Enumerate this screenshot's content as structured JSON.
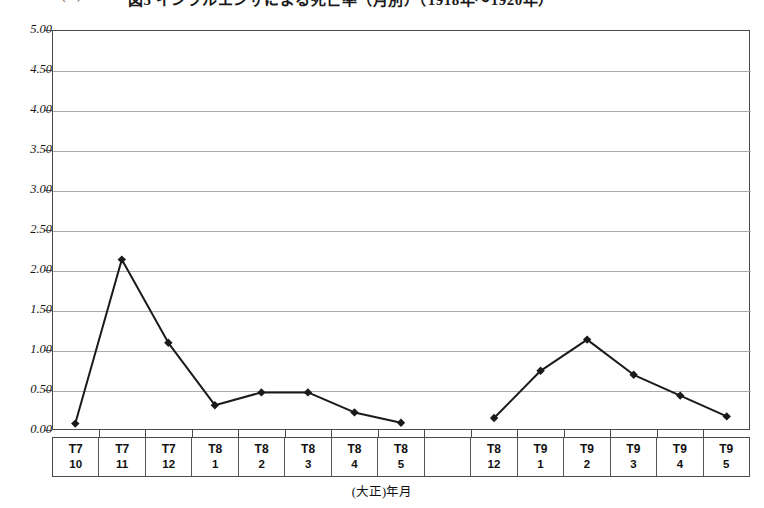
{
  "chart_data": {
    "type": "line",
    "title": "図5 インフルエンザによる死亡率（月別）（1918年～1920年）",
    "unit_label": "(‰)",
    "xlabel": "(大正)年月",
    "ylabel": "",
    "ylim": [
      0.0,
      5.0
    ],
    "ytick_step": 0.5,
    "grid": true,
    "legend": "none",
    "ytick_labels": [
      "0.00",
      "0.50",
      "1.00",
      "1.50",
      "2.00",
      "2.50",
      "3.00",
      "3.50",
      "4.00",
      "4.50",
      "5.00"
    ],
    "ytick_values": [
      0.0,
      0.5,
      1.0,
      1.5,
      2.0,
      2.5,
      3.0,
      3.5,
      4.0,
      4.5,
      5.0
    ],
    "categories": [
      {
        "year": "T7",
        "month": "10"
      },
      {
        "year": "T7",
        "month": "11"
      },
      {
        "year": "T7",
        "month": "12"
      },
      {
        "year": "T8",
        "month": "1"
      },
      {
        "year": "T8",
        "month": "2"
      },
      {
        "year": "T8",
        "month": "3"
      },
      {
        "year": "T8",
        "month": "4"
      },
      {
        "year": "T8",
        "month": "5"
      },
      {
        "year": "",
        "month": ""
      },
      {
        "year": "T8",
        "month": "12"
      },
      {
        "year": "T9",
        "month": "1"
      },
      {
        "year": "T9",
        "month": "2"
      },
      {
        "year": "T9",
        "month": "3"
      },
      {
        "year": "T9",
        "month": "4"
      },
      {
        "year": "T9",
        "month": "5"
      }
    ],
    "series": [
      {
        "name": "インフルエンザ死亡率",
        "values": [
          0.08,
          2.13,
          1.09,
          0.31,
          0.47,
          0.47,
          0.22,
          0.09,
          null,
          0.15,
          0.74,
          1.13,
          0.69,
          0.43,
          0.17
        ]
      }
    ],
    "marker": "diamond",
    "line_color": "#1a1a1a",
    "grid_color": "#aaaaaa",
    "axis_color": "#4a4a4a"
  }
}
